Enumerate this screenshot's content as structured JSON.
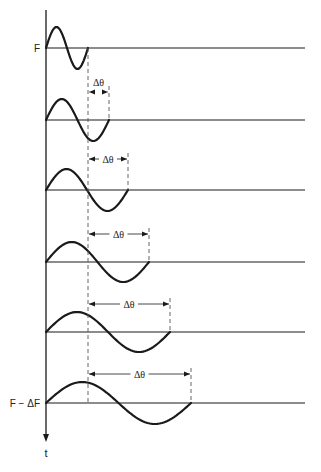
{
  "diagram": {
    "axis": {
      "x": 46,
      "y_top": 10,
      "y_bottom": 442,
      "label": "t"
    },
    "labels": {
      "top_level": "F",
      "bottom_level": "F − ΔF",
      "phase_shift": "Δθ"
    },
    "reference_dashed_x": 88,
    "baseline_right_x": 305,
    "waves": [
      {
        "baseline_y": 48,
        "end_x": 88,
        "amplitude": 21,
        "arrow_y": null,
        "label_y": null
      },
      {
        "baseline_y": 120,
        "end_x": 109,
        "amplitude": 21,
        "arrow_y": 92,
        "label_y": 86
      },
      {
        "baseline_y": 190,
        "end_x": 128,
        "amplitude": 21,
        "arrow_y": 159,
        "label_y": 162
      },
      {
        "baseline_y": 262,
        "end_x": 149,
        "amplitude": 20,
        "arrow_y": 234,
        "label_y": 237
      },
      {
        "baseline_y": 332,
        "end_x": 170,
        "amplitude": 20,
        "arrow_y": 304,
        "label_y": 307
      },
      {
        "baseline_y": 403,
        "end_x": 191,
        "amplitude": 21,
        "arrow_y": 374,
        "label_y": 377
      }
    ],
    "colors": {
      "stroke": "#1a1a1a",
      "dashed": "#555555"
    }
  }
}
